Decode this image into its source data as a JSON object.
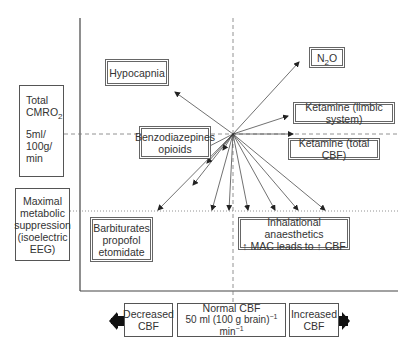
{
  "y_axis": {
    "upper_label": {
      "line1": "Total",
      "line2_main": "CMRO",
      "line2_sub": "2",
      "line3": "5ml/",
      "line4": "100g/",
      "line5": "min"
    },
    "lower_label": {
      "lines": [
        "Maximal",
        "metabolic",
        "suppression",
        "(isoelectric",
        "EEG)"
      ]
    }
  },
  "x_axis": {
    "decreased": {
      "line1": "Decreased",
      "line2": "CBF"
    },
    "normal": {
      "line1": "Normal CBF",
      "line2_a": "50 ml (100 g brain)",
      "sup1": "−1",
      "line2_b": " min",
      "sup2": "−1"
    },
    "increased": {
      "line1": "Increased",
      "line2": "CBF"
    }
  },
  "agents": {
    "hypocapnia": "Hypocapnia",
    "n2o": {
      "main": "N",
      "sub": "2",
      "tail": "O"
    },
    "ketamine_limbic": "Ketamine (limbic system)",
    "ketamine_total": "Ketamine (total CBF)",
    "benzodiazepines": {
      "line1": "Benzodiazepines",
      "line2": "opioids"
    },
    "barbiturates": {
      "line1": "Barbiturates",
      "line2": "propofol",
      "line3": "etomidate"
    },
    "inhalational": {
      "line1": "Inhalational anaesthetics",
      "line2": "↑ MAC leads to ↑ CBF"
    }
  },
  "colors": {
    "line": "#444444",
    "dashed": "#777777",
    "arrow_block": "#111111"
  }
}
